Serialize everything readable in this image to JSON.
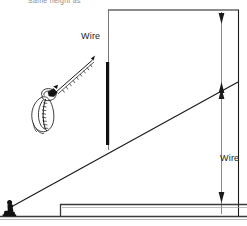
{
  "figure": {
    "caption_top": "Same height as",
    "labels": {
      "wire_upper": "Wire",
      "wire_lower": "Wire"
    }
  },
  "colors": {
    "line": "#1a1a1a",
    "thin_line": "#555555",
    "mast": "#111111",
    "ground": "#3a3a3a",
    "caption": "#8a8a8a",
    "background": "#ffffff"
  },
  "elements": {
    "person_name": "kneeling-person-holding-wire",
    "kite_name": "bird-on-wire-sketch",
    "mast_name": "vertical-mast",
    "diagonal_name": "diagonal-wire-line",
    "ground_name": "ground-line",
    "platform_name": "raised-platform",
    "dimension_upper_name": "upper-wire-height-dimension",
    "dimension_lower_name": "lower-wire-height-dimension"
  }
}
